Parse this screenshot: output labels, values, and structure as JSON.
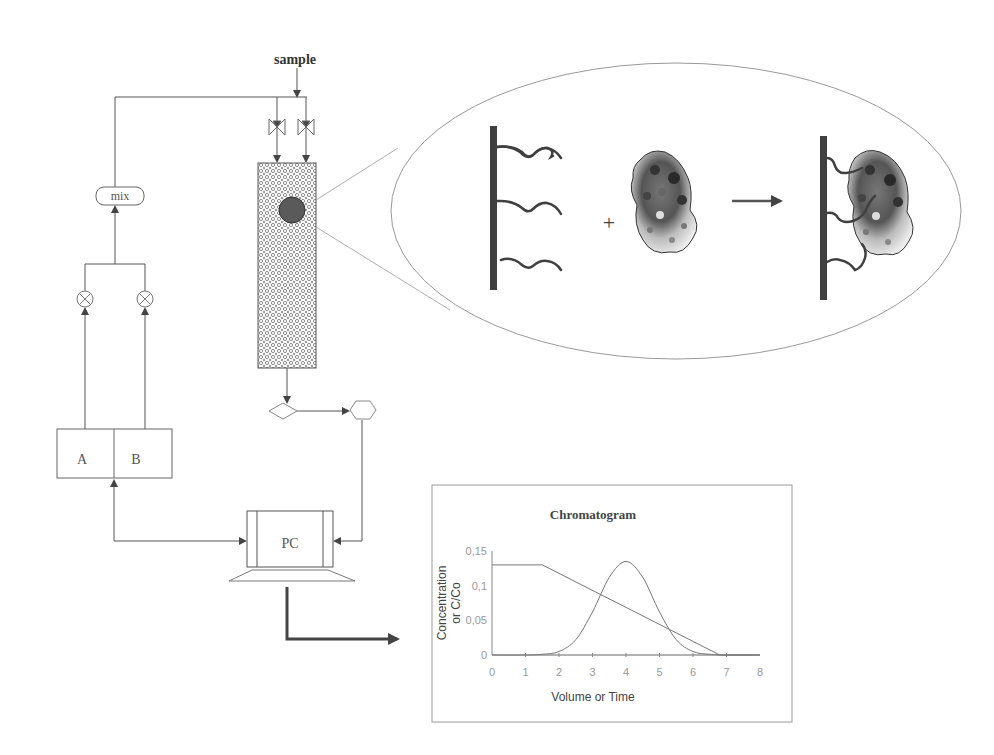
{
  "diagram": {
    "sample_label": "sample",
    "mix_label": "mix",
    "reservoir_a_label": "A",
    "reservoir_b_label": "B",
    "pc_label": "PC",
    "plus_sign": "+",
    "colors": {
      "line": "#555555",
      "dark": "#3a3a3a",
      "column_pattern": "#8a8a8a",
      "ellipse": "#9a9a9a"
    }
  },
  "chart_data": {
    "type": "line",
    "title": "Chromatogram",
    "xlabel": "Volume or Time",
    "ylabel": "Concentration or C/Co",
    "ylabel_lines": [
      "Concentration",
      "or C/Co"
    ],
    "xlim": [
      0,
      8
    ],
    "ylim": [
      0,
      0.15
    ],
    "x_ticks": [
      "0",
      "1",
      "2",
      "3",
      "4",
      "5",
      "6",
      "7",
      "8"
    ],
    "y_ticks": [
      "0",
      "0,05",
      "0,1",
      "0,15"
    ],
    "grid": false,
    "legend": "none",
    "series": [
      {
        "name": "gradient",
        "x": [
          0,
          1.5,
          6.8,
          8
        ],
        "y": [
          0.13,
          0.13,
          0,
          0
        ]
      },
      {
        "name": "elution peak",
        "x": [
          0,
          1,
          1.5,
          2,
          2.5,
          3,
          3.5,
          4,
          4.5,
          5,
          5.5,
          6,
          6.5,
          7,
          8
        ],
        "y": [
          0,
          0,
          0.001,
          0.005,
          0.022,
          0.062,
          0.112,
          0.135,
          0.112,
          0.062,
          0.022,
          0.005,
          0.001,
          0,
          0
        ]
      }
    ]
  }
}
